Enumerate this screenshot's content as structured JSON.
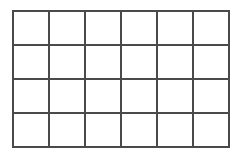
{
  "grid": {
    "rows": 4,
    "columns": 6,
    "line_color": "#4a4a4a",
    "background": "#ffffff",
    "cells": [
      [
        "",
        "",
        "",
        "",
        "",
        ""
      ],
      [
        "",
        "",
        "",
        "",
        "",
        ""
      ],
      [
        "",
        "",
        "",
        "",
        "",
        ""
      ],
      [
        "",
        "",
        "",
        "",
        "",
        ""
      ]
    ]
  }
}
